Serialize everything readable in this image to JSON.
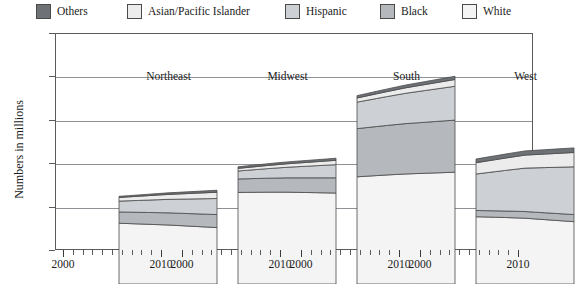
{
  "legend": {
    "items": [
      {
        "label": "Others",
        "color": "#6e7277",
        "x": 36
      },
      {
        "label": "Asian/Pacific Islander",
        "color": "#ececec",
        "x": 127
      },
      {
        "label": "Hispanic",
        "color": "#cdd0d4",
        "x": 285
      },
      {
        "label": "Black",
        "color": "#b5b8bc",
        "x": 380
      },
      {
        "label": "White",
        "color": "#f4f4f4",
        "x": 462
      }
    ]
  },
  "axes": {
    "y_label": "Numbers in millions",
    "y_ticks": [
      "0",
      "5",
      "10",
      "15",
      "20",
      "25"
    ],
    "y_min": 0,
    "y_max": 25,
    "x_start_label": "2000",
    "x_end_label": "2010"
  },
  "ghost_text": "",
  "chart_data": {
    "type": "area",
    "title": "",
    "subtitle": "",
    "xlabel": "",
    "ylabel": "Numbers in millions",
    "ylim": [
      0,
      25
    ],
    "grid": true,
    "legend_position": "top",
    "stacked": true,
    "stack_order_bottom_to_top": [
      "White",
      "Black",
      "Hispanic",
      "Asian/Pacific Islander",
      "Others"
    ],
    "x": [
      2000,
      2001,
      2002,
      2003,
      2004,
      2005,
      2006,
      2007,
      2008,
      2009,
      2010
    ],
    "panels": [
      {
        "name": "Northeast",
        "series": [
          {
            "name": "White",
            "values": [
              7.0,
              6.96,
              6.92,
              6.88,
              6.84,
              6.8,
              6.74,
              6.68,
              6.62,
              6.56,
              6.5
            ]
          },
          {
            "name": "Black",
            "values": [
              1.3,
              1.32,
              1.34,
              1.36,
              1.38,
              1.4,
              1.42,
              1.44,
              1.46,
              1.48,
              1.5
            ]
          },
          {
            "name": "Hispanic",
            "values": [
              1.25,
              1.31,
              1.37,
              1.43,
              1.49,
              1.55,
              1.61,
              1.67,
              1.73,
              1.79,
              1.85
            ]
          },
          {
            "name": "Asian/Pacific Islander",
            "values": [
              0.42,
              0.45,
              0.48,
              0.51,
              0.54,
              0.57,
              0.6,
              0.63,
              0.66,
              0.69,
              0.72
            ]
          },
          {
            "name": "Others",
            "values": [
              0.13,
              0.14,
              0.15,
              0.16,
              0.17,
              0.18,
              0.19,
              0.2,
              0.21,
              0.22,
              0.23
            ]
          }
        ],
        "totals": [
          10.1,
          10.18,
          10.26,
          10.34,
          10.42,
          10.5,
          10.56,
          10.62,
          10.68,
          10.74,
          10.8
        ]
      },
      {
        "name": "Midwest",
        "series": [
          {
            "name": "White",
            "values": [
              10.55,
              10.56,
              10.57,
              10.58,
              10.58,
              10.58,
              10.56,
              10.54,
              10.52,
              10.5,
              10.48
            ]
          },
          {
            "name": "Black",
            "values": [
              1.55,
              1.57,
              1.59,
              1.61,
              1.63,
              1.65,
              1.67,
              1.69,
              1.71,
              1.73,
              1.75
            ]
          },
          {
            "name": "Hispanic",
            "values": [
              0.92,
              0.98,
              1.04,
              1.1,
              1.16,
              1.22,
              1.28,
              1.34,
              1.4,
              1.46,
              1.52
            ]
          },
          {
            "name": "Asian/Pacific Islander",
            "values": [
              0.3,
              0.32,
              0.34,
              0.36,
              0.38,
              0.4,
              0.42,
              0.44,
              0.46,
              0.48,
              0.5
            ]
          },
          {
            "name": "Others",
            "values": [
              0.18,
              0.19,
              0.2,
              0.2,
              0.21,
              0.21,
              0.22,
              0.22,
              0.23,
              0.23,
              0.24
            ]
          }
        ],
        "totals": [
          13.5,
          13.62,
          13.74,
          13.85,
          13.96,
          14.06,
          14.15,
          14.23,
          14.32,
          14.4,
          14.49
        ]
      },
      {
        "name": "South",
        "series": [
          {
            "name": "White",
            "values": [
              12.35,
              12.42,
              12.49,
              12.56,
              12.62,
              12.68,
              12.72,
              12.76,
              12.8,
              12.84,
              12.88
            ]
          },
          {
            "name": "Black",
            "values": [
              5.55,
              5.6,
              5.65,
              5.7,
              5.75,
              5.8,
              5.84,
              5.88,
              5.92,
              5.96,
              6.0
            ]
          },
          {
            "name": "Hispanic",
            "values": [
              3.05,
              3.14,
              3.23,
              3.32,
              3.41,
              3.5,
              3.58,
              3.66,
              3.74,
              3.82,
              3.9
            ]
          },
          {
            "name": "Asian/Pacific Islander",
            "values": [
              0.48,
              0.51,
              0.54,
              0.57,
              0.6,
              0.63,
              0.66,
              0.69,
              0.72,
              0.75,
              0.78
            ]
          },
          {
            "name": "Others",
            "values": [
              0.27,
              0.28,
              0.29,
              0.3,
              0.31,
              0.32,
              0.33,
              0.34,
              0.35,
              0.36,
              0.37
            ]
          }
        ],
        "totals": [
          21.7,
          21.95,
          22.2,
          22.45,
          22.69,
          22.93,
          23.13,
          23.33,
          23.53,
          23.73,
          23.93
        ]
      },
      {
        "name": "West",
        "series": [
          {
            "name": "White",
            "values": [
              7.75,
              7.72,
              7.69,
              7.66,
              7.62,
              7.58,
              7.5,
              7.42,
              7.34,
              7.26,
              7.18
            ]
          },
          {
            "name": "Black",
            "values": [
              0.72,
              0.73,
              0.74,
              0.75,
              0.76,
              0.77,
              0.78,
              0.79,
              0.8,
              0.81,
              0.82
            ]
          },
          {
            "name": "Hispanic",
            "values": [
              4.2,
              4.36,
              4.52,
              4.68,
              4.84,
              5.0,
              5.1,
              5.2,
              5.3,
              5.4,
              5.5
            ]
          },
          {
            "name": "Asian/Pacific Islander",
            "values": [
              1.3,
              1.34,
              1.38,
              1.42,
              1.46,
              1.5,
              1.53,
              1.56,
              1.59,
              1.62,
              1.65
            ]
          },
          {
            "name": "Others",
            "values": [
              0.43,
              0.44,
              0.45,
              0.46,
              0.47,
              0.48,
              0.49,
              0.5,
              0.51,
              0.52,
              0.53
            ]
          }
        ],
        "totals": [
          14.4,
          14.59,
          14.78,
          14.97,
          15.15,
          15.33,
          15.4,
          15.47,
          15.54,
          15.61,
          15.68
        ]
      }
    ]
  }
}
